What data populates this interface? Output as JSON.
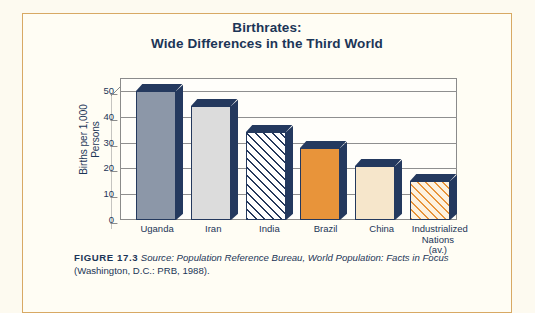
{
  "figure": {
    "title_line1": "Birthrates:",
    "title_line2": "Wide Differences in the Third World",
    "caption_label": "FIGURE 17.3",
    "caption_italic1": "Source: Population Reference Bureau, ",
    "caption_italic2": "World Population: Facts in",
    "caption_italic3": "Focus ",
    "caption_plain": "(Washington, D.C.: PRB, 1988).",
    "frame_color": "#d8a964",
    "page_background": "#fdfaf0",
    "text_color": "#1c3557"
  },
  "chart_data": {
    "type": "bar",
    "title": "Birthrates: Wide Differences in the Third World",
    "xlabel": "",
    "ylabel": "Births per 1,000 Persons",
    "ylabel_line1": "Births per 1,000",
    "ylabel_line2": "Persons",
    "categories": [
      "Uganda",
      "Iran",
      "India",
      "Brazil",
      "China",
      "Industrialized Nations (av.)"
    ],
    "category_labels": [
      {
        "line1": "Uganda",
        "line2": "",
        "line3": ""
      },
      {
        "line1": "Iran",
        "line2": "",
        "line3": ""
      },
      {
        "line1": "India",
        "line2": "",
        "line3": ""
      },
      {
        "line1": "Brazil",
        "line2": "",
        "line3": ""
      },
      {
        "line1": "China",
        "line2": "",
        "line3": ""
      },
      {
        "line1": "Industrialized",
        "line2": "Nations",
        "line3": "(av.)"
      }
    ],
    "values": [
      50,
      44,
      34,
      28,
      21,
      15
    ],
    "ylim": [
      0,
      55
    ],
    "yticks": [
      0,
      10,
      20,
      30,
      40,
      50
    ],
    "ytick_labels": [
      "0",
      "10",
      "20",
      "30",
      "40",
      "50"
    ],
    "grid": true,
    "legend": false,
    "bar_styles": [
      {
        "name": "Uganda",
        "fill": "fill-gray-blue",
        "color": "#8c97a8"
      },
      {
        "name": "Iran",
        "fill": "fill-light-gray",
        "color": "#dcdcdc"
      },
      {
        "name": "India",
        "fill": "fill-hatch-navy",
        "color": "#26395c"
      },
      {
        "name": "Brazil",
        "fill": "fill-orange",
        "color": "#e8943a"
      },
      {
        "name": "China",
        "fill": "fill-cream",
        "color": "#f6e6cb"
      },
      {
        "name": "Industrialized Nations",
        "fill": "fill-hatch-orange",
        "color": "#e8943a"
      }
    ],
    "bar_outline_color": "#24395e",
    "gridline_color": "#8f8f8f"
  }
}
